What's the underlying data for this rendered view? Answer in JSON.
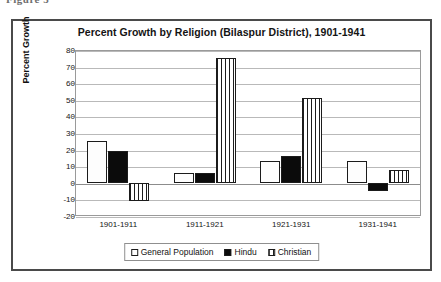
{
  "caption_fragment": "Figure 5",
  "chart_data": {
    "type": "bar",
    "title": "Percent Growth by Religion (Bilaspur District), 1901-1941",
    "xlabel": "",
    "ylabel": "Percent Growth",
    "categories": [
      "1901-1911",
      "1911-1921",
      "1921-1931",
      "1931-1941"
    ],
    "series": [
      {
        "name": "General Population",
        "pattern": "dots",
        "values": [
          25,
          6,
          13,
          13
        ]
      },
      {
        "name": "Hindu",
        "pattern": "solid",
        "values": [
          19,
          6,
          16,
          -5
        ]
      },
      {
        "name": "Christian",
        "pattern": "stripes",
        "values": [
          -11,
          75,
          51,
          8
        ]
      }
    ],
    "ylim": [
      -20,
      80
    ],
    "yticks": [
      80,
      70,
      60,
      50,
      40,
      30,
      20,
      10,
      0,
      -10,
      -20
    ],
    "grid": true,
    "legend_position": "bottom",
    "colors": {
      "axis": "#8c8c8c",
      "grid": "#b9b9b9",
      "bar_outline": "#1b1b1b",
      "frame": "#4a4a4a",
      "text": "#141414"
    }
  }
}
